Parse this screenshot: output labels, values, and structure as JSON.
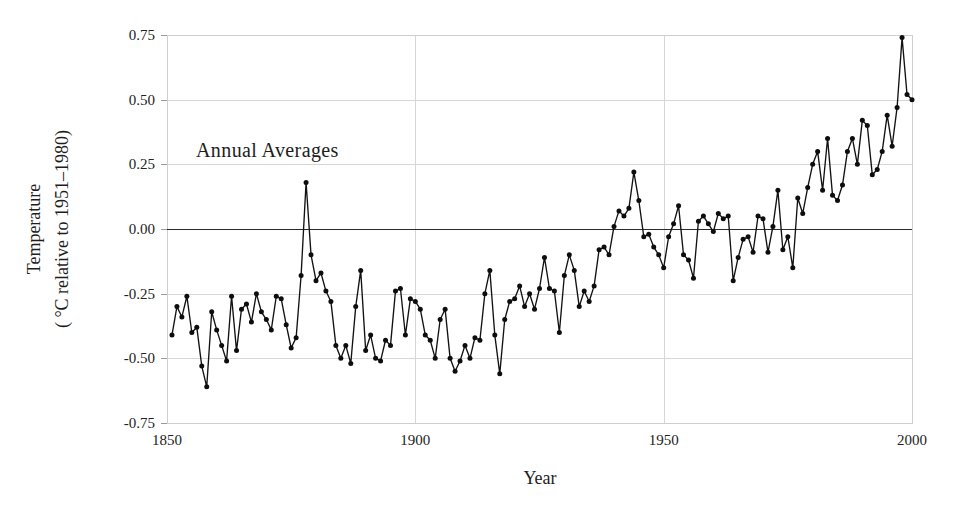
{
  "chart_data": {
    "type": "line",
    "title": "",
    "annotation": "Annual Averages",
    "xlabel": "Year",
    "ylabel_line1": "Temperature",
    "ylabel_line2": "( °C relative to 1951–1980)",
    "xlim": [
      1850,
      2000
    ],
    "ylim": [
      -0.75,
      0.75
    ],
    "xticks": [
      1850,
      1900,
      1950,
      2000
    ],
    "xtick_labels": [
      "1850",
      "1900",
      "1950",
      "2000"
    ],
    "yticks": [
      -0.75,
      -0.5,
      -0.25,
      0,
      0.25,
      0.5,
      0.75
    ],
    "ytick_labels": [
      "-0.75",
      "-0.50",
      "-0.25",
      "0.00",
      "0.25",
      "0.50",
      "0.75"
    ],
    "grid": true,
    "legend": "none",
    "zero_reference_line": 0,
    "series_name": "Global annual mean temperature anomaly",
    "marker": "filled-circle",
    "x": [
      1851,
      1852,
      1853,
      1854,
      1855,
      1856,
      1857,
      1858,
      1859,
      1860,
      1861,
      1862,
      1863,
      1864,
      1865,
      1866,
      1867,
      1868,
      1869,
      1870,
      1871,
      1872,
      1873,
      1874,
      1875,
      1876,
      1877,
      1878,
      1879,
      1880,
      1881,
      1882,
      1883,
      1884,
      1885,
      1886,
      1887,
      1888,
      1889,
      1890,
      1891,
      1892,
      1893,
      1894,
      1895,
      1896,
      1897,
      1898,
      1899,
      1900,
      1901,
      1902,
      1903,
      1904,
      1905,
      1906,
      1907,
      1908,
      1909,
      1910,
      1911,
      1912,
      1913,
      1914,
      1915,
      1916,
      1917,
      1918,
      1919,
      1920,
      1921,
      1922,
      1923,
      1924,
      1925,
      1926,
      1927,
      1928,
      1929,
      1930,
      1931,
      1932,
      1933,
      1934,
      1935,
      1936,
      1937,
      1938,
      1939,
      1940,
      1941,
      1942,
      1943,
      1944,
      1945,
      1946,
      1947,
      1948,
      1949,
      1950,
      1951,
      1952,
      1953,
      1954,
      1955,
      1956,
      1957,
      1958,
      1959,
      1960,
      1961,
      1962,
      1963,
      1964,
      1965,
      1966,
      1967,
      1968,
      1969,
      1970,
      1971,
      1972,
      1973,
      1974,
      1975,
      1976,
      1977,
      1978,
      1979,
      1980,
      1981,
      1982,
      1983,
      1984,
      1985,
      1986,
      1987,
      1988,
      1989,
      1990,
      1991,
      1992,
      1993,
      1994,
      1995,
      1996,
      1997,
      1998,
      1999,
      2000
    ],
    "y": [
      -0.41,
      -0.3,
      -0.34,
      -0.26,
      -0.4,
      -0.38,
      -0.53,
      -0.61,
      -0.32,
      -0.39,
      -0.45,
      -0.51,
      -0.26,
      -0.47,
      -0.31,
      -0.29,
      -0.36,
      -0.25,
      -0.32,
      -0.35,
      -0.39,
      -0.26,
      -0.27,
      -0.37,
      -0.46,
      -0.42,
      -0.18,
      0.18,
      -0.1,
      -0.2,
      -0.17,
      -0.24,
      -0.28,
      -0.45,
      -0.5,
      -0.45,
      -0.52,
      -0.3,
      -0.16,
      -0.47,
      -0.41,
      -0.5,
      -0.51,
      -0.43,
      -0.45,
      -0.24,
      -0.23,
      -0.41,
      -0.27,
      -0.28,
      -0.31,
      -0.41,
      -0.43,
      -0.5,
      -0.35,
      -0.31,
      -0.5,
      -0.55,
      -0.51,
      -0.45,
      -0.5,
      -0.42,
      -0.43,
      -0.25,
      -0.16,
      -0.41,
      -0.56,
      -0.35,
      -0.28,
      -0.27,
      -0.22,
      -0.3,
      -0.25,
      -0.31,
      -0.23,
      -0.11,
      -0.23,
      -0.24,
      -0.4,
      -0.18,
      -0.1,
      -0.16,
      -0.3,
      -0.24,
      -0.28,
      -0.22,
      -0.08,
      -0.07,
      -0.1,
      0.01,
      0.07,
      0.05,
      0.08,
      0.22,
      0.11,
      -0.03,
      -0.02,
      -0.07,
      -0.1,
      -0.15,
      -0.03,
      0.02,
      0.09,
      -0.1,
      -0.12,
      -0.19,
      0.03,
      0.05,
      0.02,
      -0.01,
      0.06,
      0.04,
      0.05,
      -0.2,
      -0.11,
      -0.04,
      -0.03,
      -0.09,
      0.05,
      0.04,
      -0.09,
      0.01,
      0.15,
      -0.08,
      -0.03,
      -0.15,
      0.12,
      0.06,
      0.16,
      0.25,
      0.3,
      0.15,
      0.35,
      0.13,
      0.11,
      0.17,
      0.3,
      0.35,
      0.25,
      0.42,
      0.4,
      0.21,
      0.23,
      0.3,
      0.44,
      0.32,
      0.47,
      0.74,
      0.52,
      0.5
    ]
  },
  "plot_geometry": {
    "left": 167,
    "right": 912,
    "top": 35,
    "bottom": 423
  }
}
